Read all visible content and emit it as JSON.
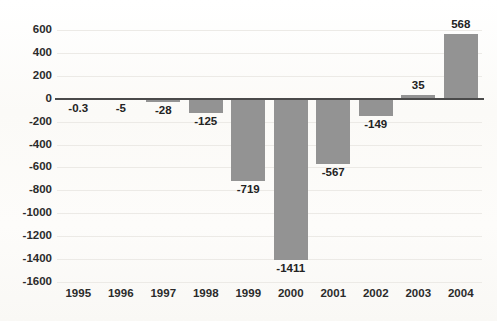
{
  "ghost_overlay": {
    "text": "                                                "
  },
  "style": {
    "bar_color": "#939393",
    "axis_color": "#4a4a4a",
    "gridline_color": "#eceae6",
    "text_color": "#2b2b2b",
    "background_color": "#fcfbf9"
  },
  "chart_data": {
    "type": "bar",
    "title": "",
    "subtitle": "",
    "xlabel": "",
    "ylabel": "",
    "categories": [
      "1995",
      "1996",
      "1997",
      "1998",
      "1999",
      "2000",
      "2001",
      "2002",
      "2003",
      "2004"
    ],
    "values": [
      -0.3,
      -5,
      -28,
      -125,
      -719,
      -1411,
      -567,
      -149,
      35,
      568
    ],
    "value_labels": [
      "-0.3",
      "-5",
      "-28",
      "-125",
      "-719",
      "-1411",
      "-567",
      "-149",
      "35",
      "568"
    ],
    "ylim": [
      -1600,
      600
    ],
    "ytick_step": 200,
    "ytick_labels": [
      "600",
      "400",
      "200",
      "0",
      "-200",
      "-400",
      "-600",
      "-800",
      "-1000",
      "-1200",
      "-1400",
      "-1600"
    ],
    "ytick_values": [
      600,
      400,
      200,
      0,
      -200,
      -400,
      -600,
      -800,
      -1000,
      -1200,
      -1400,
      -1600
    ],
    "grid": true,
    "legend": false,
    "legend_position": "none",
    "series": [
      {
        "name": "",
        "values": [
          -0.3,
          -5,
          -28,
          -125,
          -719,
          -1411,
          -567,
          -149,
          35,
          568
        ]
      }
    ]
  }
}
